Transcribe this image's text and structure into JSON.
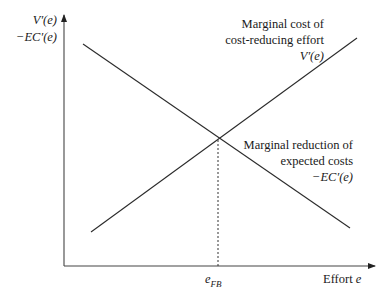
{
  "diagram": {
    "type": "economics-marginal-curves",
    "y_axis": {
      "labels": [
        "V′(e)",
        "−EC′(e)"
      ]
    },
    "x_axis": {
      "label_text": "Effort ",
      "label_var": "e"
    },
    "curves": [
      {
        "id": "marginal-cost",
        "label_lines": [
          "Marginal cost of",
          "cost-reducing effort",
          "V′(e)"
        ],
        "direction": "increasing",
        "points": [
          [
            91,
            232
          ],
          [
            357,
            38
          ]
        ]
      },
      {
        "id": "marginal-reduction",
        "label_lines": [
          "Marginal reduction of",
          "expected costs",
          "−EC′(e)"
        ],
        "direction": "decreasing",
        "points": [
          [
            83,
            44
          ],
          [
            350,
            228
          ]
        ]
      }
    ],
    "intersection": {
      "label_var": "e",
      "label_sub": "FB",
      "x": 218,
      "y": 140
    },
    "colors": {
      "line": "#2a2a2a",
      "axis": "#333333"
    }
  }
}
